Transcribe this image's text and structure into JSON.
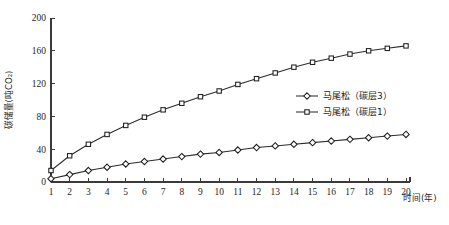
{
  "chart_data": {
    "type": "line",
    "title": "",
    "xlabel": "时间(年)",
    "ylabel": "碳储量(吨CO₂)",
    "xlim": [
      0,
      20
    ],
    "ylim": [
      0,
      200
    ],
    "grid": false,
    "legend_position": "center-right",
    "x": [
      1,
      2,
      3,
      4,
      5,
      6,
      7,
      8,
      9,
      10,
      11,
      12,
      13,
      14,
      15,
      16,
      17,
      18,
      19,
      20
    ],
    "categories": [
      "1",
      "2",
      "3",
      "4",
      "5",
      "6",
      "7",
      "8",
      "9",
      "10",
      "11",
      "12",
      "13",
      "14",
      "15",
      "16",
      "17",
      "18",
      "19",
      "20"
    ],
    "yticks": [
      0,
      40,
      80,
      120,
      160,
      200
    ],
    "ytick_labels": [
      "0",
      "40",
      "80",
      "120",
      "160",
      "200"
    ],
    "series": [
      {
        "name": "马尾松（碳层1）",
        "marker": "square",
        "values": [
          14,
          32,
          46,
          58,
          69,
          79,
          88,
          96,
          104,
          111,
          119,
          126,
          133,
          140,
          146,
          151,
          156,
          160,
          163,
          166
        ]
      },
      {
        "name": "马尾松（碳层3）",
        "marker": "diamond",
        "values": [
          4,
          9,
          14,
          18,
          22,
          25,
          28,
          31,
          34,
          36,
          39,
          42,
          44,
          46,
          48,
          50,
          52,
          54,
          56,
          58
        ]
      }
    ]
  },
  "legend": {
    "entries": [
      {
        "label": "马尾松（碳层3）",
        "marker": "diamond"
      },
      {
        "label": "马尾松（碳层1）",
        "marker": "square"
      }
    ]
  },
  "axes": {
    "y_title": "碳储量(吨CO₂)",
    "x_title": "时间(年)"
  }
}
